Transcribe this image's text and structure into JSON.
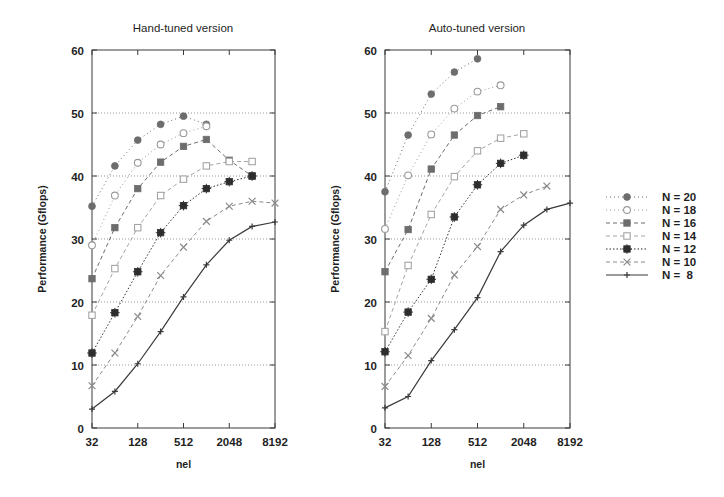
{
  "figure": {
    "width": 724,
    "height": 497,
    "background": "#ffffff",
    "ink": "#1f1f1f"
  },
  "axis_label_x": "nel",
  "axis_label_y": "Performance (Gflops)",
  "legend": {
    "position": "right",
    "entries": [
      {
        "label": "N = 20",
        "series": "N20"
      },
      {
        "label": "N = 18",
        "series": "N18"
      },
      {
        "label": "N = 16",
        "series": "N16"
      },
      {
        "label": "N = 14",
        "series": "N14"
      },
      {
        "label": "N = 12",
        "series": "N12"
      },
      {
        "label": "N = 10",
        "series": "N10"
      },
      {
        "label": "N =  8",
        "series": "N8"
      }
    ]
  },
  "series_style": {
    "N20": {
      "marker": "filled-circle",
      "dash": "1,3",
      "color": "#6d6d6d",
      "size": 3.4
    },
    "N18": {
      "marker": "open-circle",
      "dash": "1,3",
      "color": "#9a9a9a",
      "size": 3.4
    },
    "N16": {
      "marker": "filled-square",
      "dash": "4,3",
      "color": "#6d6d6d",
      "size": 3.2
    },
    "N14": {
      "marker": "open-square",
      "dash": "4,3",
      "color": "#a5a5a5",
      "size": 3.2
    },
    "N12": {
      "marker": "star-square",
      "dash": "1.5,2",
      "color": "#2e2e2e",
      "size": 3.2
    },
    "N10": {
      "marker": "cross-x",
      "dash": "4,3",
      "color": "#8a8a8a",
      "size": 3.4
    },
    "N8": {
      "marker": "plus",
      "dash": "none",
      "color": "#3a3a3a",
      "size": 3.0
    }
  },
  "chart_data": [
    {
      "type": "line",
      "title": "Hand-tuned version",
      "xlabel": "nel",
      "ylabel": "Performance (Gflops)",
      "xscale": "log2",
      "xticks": [
        32,
        128,
        512,
        2048,
        8192
      ],
      "xticklabels": [
        "32",
        "128",
        "512",
        "2048",
        "8192"
      ],
      "xlim": [
        32,
        8192
      ],
      "ylim": [
        0,
        60
      ],
      "yticks": [
        0,
        10,
        20,
        30,
        40,
        50,
        60
      ],
      "yticklabels": [
        "0",
        "10",
        "20",
        "30",
        "40",
        "50",
        "60"
      ],
      "grid": true,
      "legend": [
        "N = 20",
        "N = 18",
        "N = 16",
        "N = 14",
        "N = 12",
        "N = 10",
        "N =  8"
      ],
      "series": [
        {
          "name": "N = 20",
          "key": "N20",
          "x": [
            32,
            64,
            128,
            256,
            512,
            1024
          ],
          "values": [
            35.2,
            41.6,
            45.7,
            48.2,
            49.5,
            48.2
          ]
        },
        {
          "name": "N = 18",
          "key": "N18",
          "x": [
            32,
            64,
            128,
            256,
            512,
            1024
          ],
          "values": [
            29.0,
            36.9,
            42.1,
            45.0,
            46.8,
            47.9
          ]
        },
        {
          "name": "N = 16",
          "key": "N16",
          "x": [
            32,
            64,
            128,
            256,
            512,
            1024,
            2048,
            4096
          ],
          "values": [
            23.7,
            31.8,
            38.0,
            42.2,
            44.7,
            45.8,
            42.5,
            40.0
          ]
        },
        {
          "name": "N = 14",
          "key": "N14",
          "x": [
            32,
            64,
            128,
            256,
            512,
            1024,
            2048,
            4096
          ],
          "values": [
            17.9,
            25.3,
            31.8,
            36.9,
            39.5,
            41.6,
            42.3,
            42.3
          ]
        },
        {
          "name": "N = 12",
          "key": "N12",
          "x": [
            32,
            64,
            128,
            256,
            512,
            1024,
            2048,
            4096
          ],
          "values": [
            11.9,
            18.3,
            24.8,
            31.0,
            35.3,
            38.0,
            39.1,
            40.0
          ]
        },
        {
          "name": "N = 10",
          "key": "N10",
          "x": [
            32,
            64,
            128,
            256,
            512,
            1024,
            2048,
            4096,
            8192
          ],
          "values": [
            6.7,
            11.9,
            17.7,
            24.2,
            28.7,
            32.8,
            35.2,
            36.0,
            35.7
          ]
        },
        {
          "name": "N =  8",
          "key": "N8",
          "x": [
            32,
            64,
            128,
            256,
            512,
            1024,
            2048,
            4096,
            8192
          ],
          "values": [
            3.0,
            5.8,
            10.2,
            15.3,
            20.8,
            25.9,
            29.8,
            32.0,
            32.7
          ]
        }
      ]
    },
    {
      "type": "line",
      "title": "Auto-tuned version",
      "xlabel": "nel",
      "ylabel": "Performance (Gflops)",
      "xscale": "log2",
      "xticks": [
        32,
        128,
        512,
        2048,
        8192
      ],
      "xticklabels": [
        "32",
        "128",
        "512",
        "2048",
        "8192"
      ],
      "xlim": [
        32,
        8192
      ],
      "ylim": [
        0,
        60
      ],
      "yticks": [
        0,
        10,
        20,
        30,
        40,
        50,
        60
      ],
      "yticklabels": [
        "0",
        "10",
        "20",
        "30",
        "40",
        "50",
        "60"
      ],
      "grid": true,
      "legend": [
        "N = 20",
        "N = 18",
        "N = 16",
        "N = 14",
        "N = 12",
        "N = 10",
        "N =  8"
      ],
      "series": [
        {
          "name": "N = 20",
          "key": "N20",
          "x": [
            32,
            64,
            128,
            256,
            512
          ],
          "values": [
            37.5,
            46.5,
            53.0,
            56.5,
            58.6
          ]
        },
        {
          "name": "N = 18",
          "key": "N18",
          "x": [
            32,
            64,
            128,
            256,
            512,
            1024
          ],
          "values": [
            31.6,
            40.1,
            46.6,
            50.7,
            53.4,
            54.4
          ]
        },
        {
          "name": "N = 16",
          "key": "N16",
          "x": [
            32,
            64,
            128,
            256,
            512,
            1024
          ],
          "values": [
            24.8,
            31.5,
            41.1,
            46.5,
            49.6,
            51.0
          ]
        },
        {
          "name": "N = 14",
          "key": "N14",
          "x": [
            32,
            64,
            128,
            256,
            512,
            1024,
            2048
          ],
          "values": [
            15.3,
            25.8,
            33.9,
            39.9,
            44.0,
            46.0,
            46.7
          ]
        },
        {
          "name": "N = 12",
          "key": "N12",
          "x": [
            32,
            64,
            128,
            256,
            512,
            1024,
            2048
          ],
          "values": [
            12.1,
            18.4,
            23.6,
            33.5,
            38.6,
            42.0,
            43.3
          ]
        },
        {
          "name": "N = 10",
          "key": "N10",
          "x": [
            32,
            64,
            128,
            256,
            512,
            1024,
            2048,
            4096
          ],
          "values": [
            6.6,
            11.5,
            17.4,
            24.3,
            28.8,
            34.7,
            37.0,
            38.4
          ]
        },
        {
          "name": "N =  8",
          "key": "N8",
          "x": [
            32,
            64,
            128,
            256,
            512,
            1024,
            2048,
            4096,
            8192
          ],
          "values": [
            3.2,
            5.0,
            10.7,
            15.6,
            20.7,
            28.0,
            32.2,
            34.7,
            35.7
          ]
        }
      ]
    }
  ],
  "layout": {
    "panels": [
      {
        "x": 92,
        "y": 50,
        "w": 183,
        "h": 378,
        "title_x": 183,
        "title_y": 32
      },
      {
        "x": 385,
        "y": 50,
        "w": 185,
        "h": 378,
        "title_x": 477,
        "title_y": 32
      }
    ],
    "legend_box": {
      "sample_x": 606,
      "sample_w": 42,
      "text_x": 662,
      "y_start": 197,
      "row_h": 13
    }
  }
}
